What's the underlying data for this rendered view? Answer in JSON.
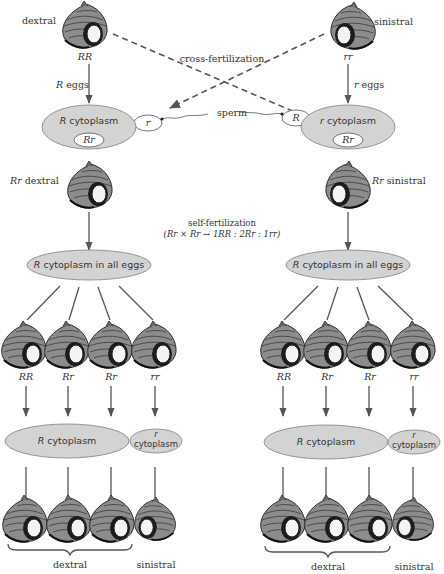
{
  "diagram": {
    "parents": {
      "left": {
        "phenotype": "dextral",
        "genotype": "RR",
        "eggs": "R eggs",
        "eggs_italic": "R",
        "eggs_rest": " eggs"
      },
      "right": {
        "phenotype": "sinistral",
        "genotype": "rr",
        "eggs": "r eggs",
        "eggs_italic": "r",
        "eggs_rest": " eggs"
      }
    },
    "cross_label": "cross-fertilization",
    "sperm_label": "sperm",
    "sperm": {
      "left": "r",
      "right": "R"
    },
    "zygotes": {
      "left": {
        "cytoplasm_italic": "R",
        "cytoplasm_rest": " cytoplasm",
        "nucleus": "Rr"
      },
      "right": {
        "cytoplasm_italic": "r",
        "cytoplasm_rest": " cytoplasm",
        "nucleus": "Rr"
      }
    },
    "f1": {
      "left": {
        "genotype": "Rr",
        "phenotype": " dextral"
      },
      "right": {
        "genotype": "Rr",
        "phenotype": " sinistral"
      }
    },
    "self_fert": {
      "title": "self-fertilization",
      "formula": "(Rr × Rr → 1RR : 2Rr : 1rr)"
    },
    "egg_pool": {
      "left": {
        "italic": "R",
        "rest": " cytoplasm in all eggs"
      },
      "right": {
        "italic": "R",
        "rest": " cytoplasm in all eggs"
      }
    },
    "f2_genotypes": [
      "RR",
      "Rr",
      "Rr",
      "rr"
    ],
    "f2_cytoplasm": {
      "big_italic": "R",
      "big_rest": " cytoplasm",
      "small_top": "r",
      "small_bottom": "cytoplasm"
    },
    "f3_labels": {
      "dextral": "dextral",
      "sinistral": "sinistral"
    }
  },
  "colors": {
    "cytoplasm_fill": "#d3d3d3",
    "line": "#555555",
    "text": "#333333"
  }
}
